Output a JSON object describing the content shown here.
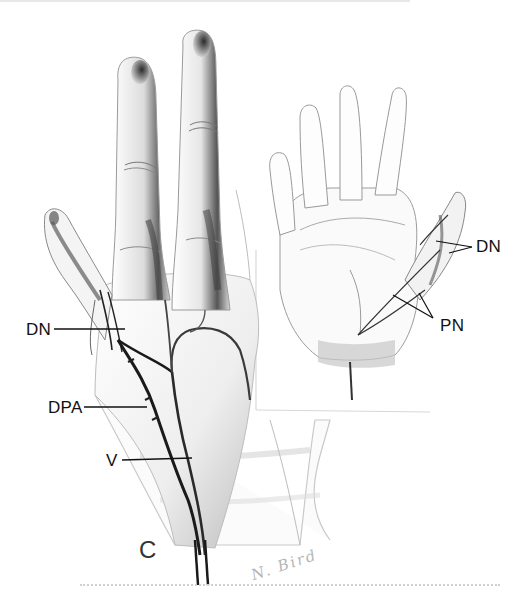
{
  "figure": {
    "panel_letter": "C",
    "signature": "N. Bird",
    "main_view": "dorsal-hand",
    "inset_view": "palmar-hand"
  },
  "labels": {
    "main": [
      {
        "id": "dn",
        "text": "DN"
      },
      {
        "id": "dpa",
        "text": "DPA"
      },
      {
        "id": "v",
        "text": "V"
      }
    ],
    "inset": [
      {
        "id": "dn",
        "text": "DN"
      },
      {
        "id": "pn",
        "text": "PN"
      }
    ]
  },
  "colors": {
    "background": "#ffffff",
    "ink": "#111111",
    "shade": "#555555",
    "light_shade": "#bbbbbb"
  }
}
